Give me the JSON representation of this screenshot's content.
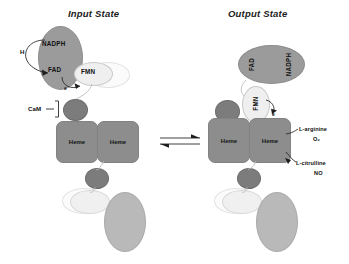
{
  "figure": {
    "type": "diagram",
    "panels": [
      {
        "id": "input",
        "title": "Input State",
        "domains": [
          {
            "name": "NADPH",
            "label": "NADPH"
          },
          {
            "name": "FAD",
            "label": "FAD"
          },
          {
            "name": "FMN",
            "label": "FMN"
          },
          {
            "name": "heme-left",
            "label": "Heme"
          },
          {
            "name": "heme-right",
            "label": "Heme"
          }
        ],
        "annotations": [
          {
            "name": "proton",
            "label": "H"
          },
          {
            "name": "electron",
            "label": "e"
          },
          {
            "name": "calmodulin",
            "label": "CaM"
          }
        ]
      },
      {
        "id": "output",
        "title": "Output State",
        "domains": [
          {
            "name": "NADPH",
            "label": "NADPH"
          },
          {
            "name": "FAD",
            "label": "FAD"
          },
          {
            "name": "FMN",
            "label": "FMN"
          },
          {
            "name": "heme-left",
            "label": "Heme"
          },
          {
            "name": "heme-right",
            "label": "Heme"
          }
        ],
        "annotations": [
          {
            "name": "electron",
            "label": "e"
          },
          {
            "name": "substrate-1",
            "label": "L-arginine"
          },
          {
            "name": "substrate-2",
            "label": "O₂"
          },
          {
            "name": "product-1",
            "label": "L-citrulline"
          },
          {
            "name": "product-2",
            "label": "NO"
          }
        ]
      }
    ],
    "connector": {
      "name": "equilibrium-arrow",
      "glyph": "⇌"
    },
    "colors": {
      "reductase_fill": "#9b9b9b",
      "fmn_fill": "#efefef",
      "heme_fill": "#8d8d8d",
      "cam_fill": "#7c7c7c",
      "ghost_fill": "#fbfbfb",
      "big_light_fill": "#b9b9b9",
      "ink": "#1d1d1d",
      "background": "#ffffff"
    }
  }
}
